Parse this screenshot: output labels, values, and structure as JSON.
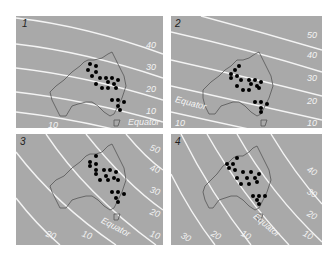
{
  "figure": {
    "panels": [
      {
        "number": "1",
        "left_labels": [
          "10"
        ],
        "right_labels": [
          "40",
          "30",
          "20",
          "10"
        ],
        "equator_label": "Equator"
      },
      {
        "number": "2",
        "left_labels": [
          "10"
        ],
        "right_labels": [
          "50",
          "40",
          "30",
          "20",
          "10"
        ],
        "equator_label": "Equator"
      },
      {
        "number": "3",
        "bottom_labels": [
          "20",
          "10"
        ],
        "right_labels": [
          "50",
          "40",
          "30",
          "20",
          "10"
        ],
        "equator_label": "Equator"
      },
      {
        "number": "4",
        "bottom_labels": [
          "30",
          "20",
          "10"
        ],
        "right_labels": [
          "40",
          "30",
          "20",
          "10"
        ],
        "equator_label": "Equator"
      }
    ],
    "colors": {
      "background": "#a9a9a9",
      "lines": "#f4f4f4",
      "outline": "#555555",
      "dots": "#000000"
    }
  }
}
